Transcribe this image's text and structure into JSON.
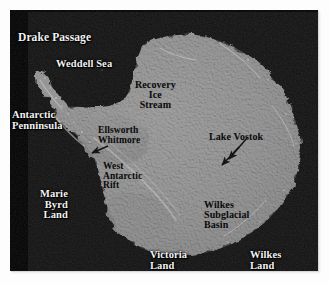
{
  "figure": {
    "kind": "raster-map-image",
    "background_color": "#ffffff",
    "plate_color": "#000000",
    "ice_color": "#8a8a8a",
    "ocean_color": "#030303"
  },
  "labels": [
    {
      "id": "drake-passage",
      "text": "Drake Passage",
      "lines": [
        "Drake Passage"
      ],
      "style": "light",
      "align": "left",
      "x": 8,
      "y": 22,
      "size": 11.5
    },
    {
      "id": "weddell-sea",
      "text": "Weddell Sea",
      "lines": [
        "Weddell Sea"
      ],
      "style": "light",
      "align": "left",
      "x": 46,
      "y": 49,
      "size": 10.5
    },
    {
      "id": "antarctic-penninsula",
      "text": "Antarctic Penninsula",
      "lines": [
        "Antarctic",
        "Penninsula"
      ],
      "style": "light",
      "align": "left",
      "x": 2,
      "y": 100,
      "size": 10.5
    },
    {
      "id": "recovery-ice-stream",
      "text": "Recovery Ice Stream",
      "lines": [
        "Recovery",
        "Ice",
        "Stream"
      ],
      "style": "dark",
      "align": "center",
      "x": 125,
      "y": 70,
      "size": 10.0
    },
    {
      "id": "ellsworth-whitmore",
      "text": "Ellsworth Whitmore",
      "lines": [
        "Ellsworth",
        "Whitmore"
      ],
      "style": "dark",
      "align": "left",
      "x": 88,
      "y": 116,
      "size": 9.5
    },
    {
      "id": "lake-vostok",
      "text": "Lake Vostok",
      "lines": [
        "Lake Vostok"
      ],
      "style": "dark",
      "align": "left",
      "x": 199,
      "y": 122,
      "size": 10.0
    },
    {
      "id": "west-antarctic-rift",
      "text": "West Antarctic Rift",
      "lines": [
        "West",
        "Antarctic",
        "Rift"
      ],
      "style": "dark",
      "align": "left",
      "x": 93,
      "y": 152,
      "size": 9.5
    },
    {
      "id": "marie-byrd-land",
      "text": "Marie Byrd Land",
      "lines": [
        "Marie",
        "Byrd",
        "Land"
      ],
      "style": "light",
      "align": "right",
      "x": 30,
      "y": 179,
      "size": 10.5
    },
    {
      "id": "wilkes-subglacial-basin",
      "text": "Wilkes Subglacial Basin",
      "lines": [
        "Wilkes",
        "Subglacial",
        "Basin"
      ],
      "style": "dark",
      "align": "left",
      "x": 194,
      "y": 190,
      "size": 10.0
    },
    {
      "id": "victoria-land",
      "text": "Victoria Land",
      "lines": [
        "Victoria",
        "Land"
      ],
      "style": "light",
      "align": "left",
      "x": 140,
      "y": 240,
      "size": 10.5
    },
    {
      "id": "wilkes-land",
      "text": "Wilkes Land",
      "lines": [
        "Wilkes",
        "Land"
      ],
      "style": "light",
      "align": "left",
      "x": 240,
      "y": 240,
      "size": 10.5
    }
  ],
  "annotations": {
    "pointer_arrows": [
      {
        "id": "arrow-ellsworth-whitmore",
        "target": "Ellsworth Whitmore",
        "from_x": 98,
        "from_y": 136,
        "to_x": 80,
        "to_y": 144
      },
      {
        "id": "arrow-lake-vostok",
        "target": "Lake Vostok",
        "from_x": 229,
        "from_y": 137,
        "to_x": 210,
        "to_y": 156
      },
      {
        "id": "arrow-wilkes-subglacial",
        "target": "Wilkes Subglacial Basin",
        "from_x": 235,
        "from_y": 128,
        "to_x": 216,
        "to_y": 150
      }
    ]
  }
}
